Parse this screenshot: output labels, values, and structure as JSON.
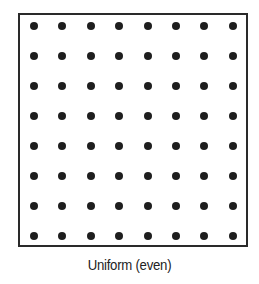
{
  "diagram": {
    "caption": "Uniform (even)",
    "grid": {
      "rows": 8,
      "cols": 8
    },
    "dot_color": "#1e1e1e",
    "border_color": "#2a2a2a"
  }
}
